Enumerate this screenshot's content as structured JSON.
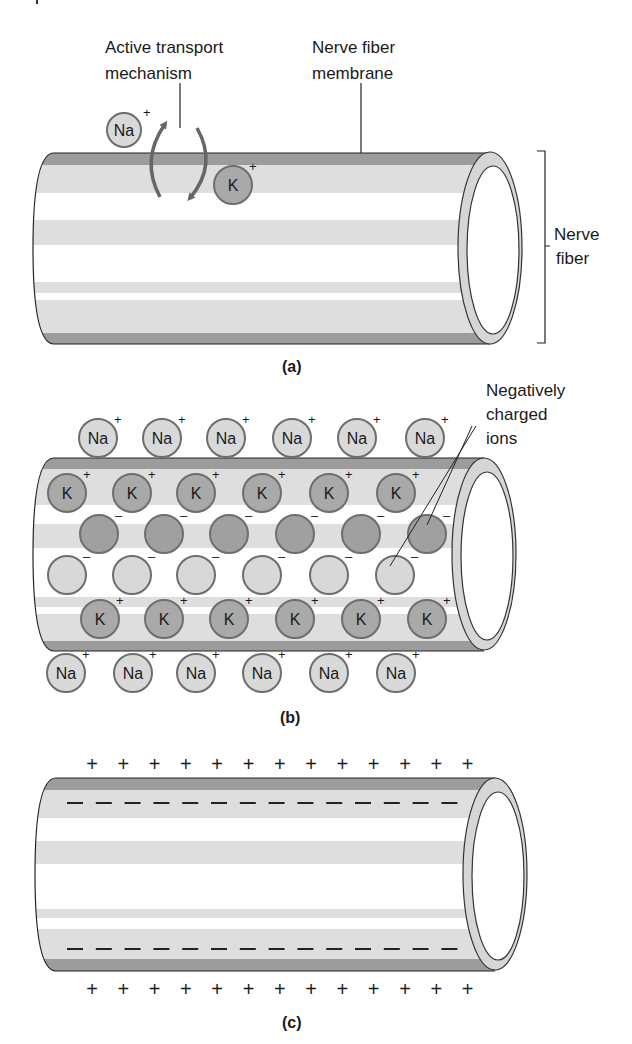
{
  "figure": {
    "colors": {
      "membrane_dark": "#9c9c9c",
      "band_light": "#dedede",
      "ring_fill": "#d6d6d6",
      "ion_na_fill": "#d9d9d9",
      "ion_k_fill": "#a9a9a9",
      "neg_dark_fill": "#a0a0a0",
      "neg_light_fill": "#d8d8d8",
      "ion_stroke": "#6e6e6e",
      "arrow": "#666666",
      "line": "#222222"
    },
    "panel_a": {
      "caption": "(a)",
      "labels": {
        "active_transport_line1": "Active transport",
        "active_transport_line2": "mechanism",
        "membrane_line1": "Nerve fiber",
        "membrane_line2": "membrane",
        "fiber_line1": "Nerve",
        "fiber_line2": "fiber"
      },
      "ions": [
        {
          "symbol": "Na",
          "charge": "+"
        },
        {
          "symbol": "K",
          "charge": "+"
        }
      ]
    },
    "panel_b": {
      "caption": "(b)",
      "labels": {
        "neg_line1": "Negatively",
        "neg_line2": "charged",
        "neg_line3": "ions"
      },
      "na_symbol": "Na",
      "k_symbol": "K",
      "positive": "+",
      "negative": "–",
      "na_top_x": [
        98,
        162,
        226,
        292,
        357,
        425
      ],
      "k_row1_x": [
        67,
        132,
        196,
        262,
        329,
        396
      ],
      "neg_dark_x": [
        99,
        164,
        229,
        295,
        361,
        427
      ],
      "neg_light_x": [
        67,
        132,
        196,
        262,
        329,
        395
      ],
      "k_row2_x": [
        100,
        164,
        229,
        295,
        361,
        427
      ],
      "na_bottom_x": [
        66,
        133,
        196,
        262,
        329,
        396
      ]
    },
    "panel_c": {
      "caption": "(c)",
      "plus_symbol": "+",
      "plus_count": 13,
      "minus_count": 14
    }
  }
}
